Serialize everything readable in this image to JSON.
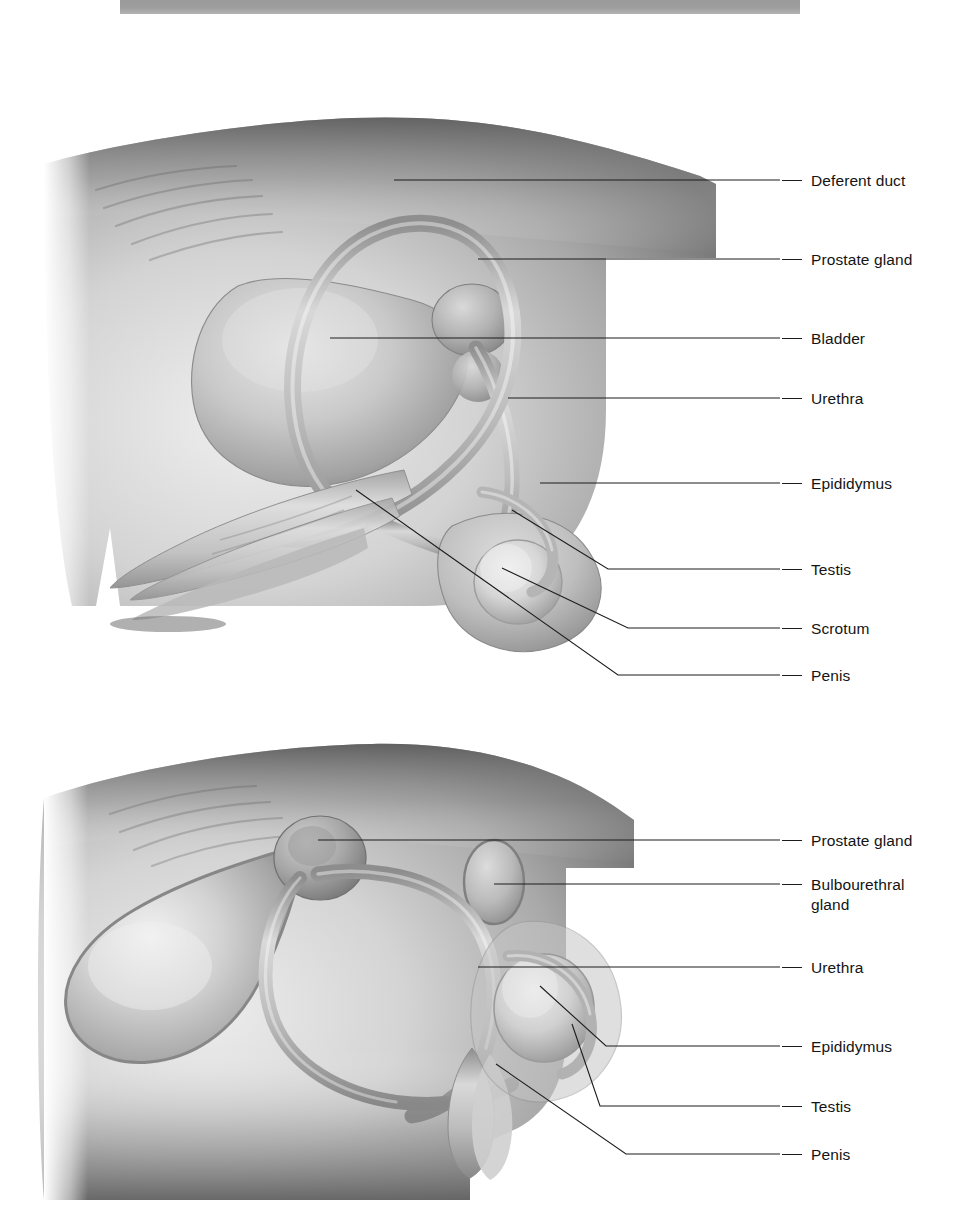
{
  "page": {
    "background": "#ffffff",
    "scan_band": {
      "color": "#9e9e9e"
    }
  },
  "figures": [
    {
      "id": "upper",
      "name": "male-reproductive-system-sagittal-upper",
      "style": "grayscale-airbrush-anatomical-illustration",
      "labels": [
        {
          "text": "Deferent duct",
          "y": 122,
          "leader": "straight"
        },
        {
          "text": "Prostate gland",
          "y": 201,
          "leader": "straight"
        },
        {
          "text": "Bladder",
          "y": 280,
          "leader": "straight"
        },
        {
          "text": "Urethra",
          "y": 340,
          "leader": "straight"
        },
        {
          "text": "Epididymus",
          "y": 425,
          "leader": "straight"
        },
        {
          "text": "Testis",
          "y": 511,
          "leader": "elbow"
        },
        {
          "text": "Scrotum",
          "y": 570,
          "leader": "elbow"
        },
        {
          "text": "Penis",
          "y": 617,
          "leader": "elbow"
        }
      ]
    },
    {
      "id": "lower",
      "name": "male-reproductive-system-sagittal-lower",
      "style": "grayscale-airbrush-anatomical-illustration",
      "labels": [
        {
          "text": "Prostate gland",
          "y": 122,
          "leader": "straight"
        },
        {
          "text": "Bulbourethral\ngland",
          "y": 166,
          "leader": "straight"
        },
        {
          "text": "Urethra",
          "y": 249,
          "leader": "straight"
        },
        {
          "text": "Epididymus",
          "y": 328,
          "leader": "elbow"
        },
        {
          "text": "Testis",
          "y": 388,
          "leader": "elbow"
        },
        {
          "text": "Penis",
          "y": 436,
          "leader": "elbow"
        }
      ]
    }
  ],
  "anatomy_parts": [
    "body-wall",
    "bladder",
    "deferent-duct",
    "prostate-gland",
    "urethra",
    "penis",
    "testis",
    "epididymus",
    "scrotum",
    "bulbourethral-gland"
  ]
}
